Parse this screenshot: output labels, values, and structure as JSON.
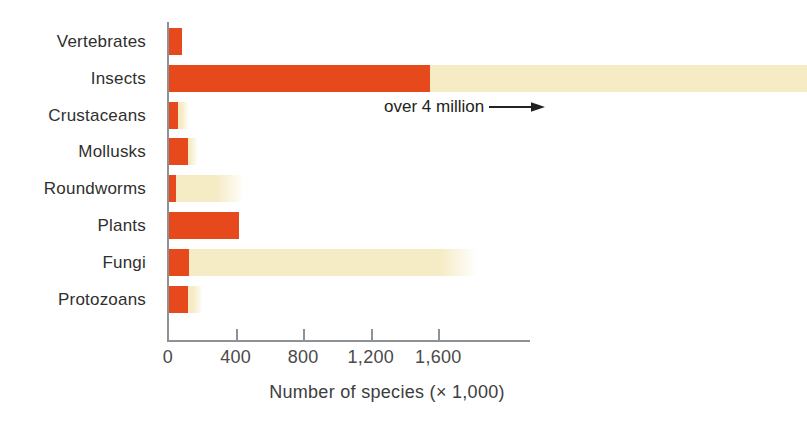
{
  "chart_data": {
    "type": "bar",
    "orientation": "horizontal",
    "xlabel": "Number of species (× 1,000)",
    "x_ticks": [
      0,
      400,
      800,
      1200,
      1600
    ],
    "x_tick_labels": [
      "0",
      "400",
      "800",
      "1,200",
      "1,600"
    ],
    "xlim": [
      0,
      2150
    ],
    "grid": false,
    "legend": "none",
    "annotation": {
      "text": "over 4 million",
      "refers_to": "Insects",
      "arrow_direction": "right"
    },
    "categories": [
      "Vertebrates",
      "Insects",
      "Crustaceans",
      "Mollusks",
      "Roundworms",
      "Plants",
      "Fungi",
      "Protozoans"
    ],
    "bars": [
      {
        "label": "Vertebrates",
        "red_k": 80,
        "cream_k": null,
        "fade_from_k": null,
        "cream_to_edge": false
      },
      {
        "label": "Insects",
        "red_k": 1550,
        "cream_k": null,
        "fade_from_k": null,
        "cream_to_edge": true
      },
      {
        "label": "Crustaceans",
        "red_k": 60,
        "cream_k": 125,
        "fade_from_k": 80,
        "cream_to_edge": false
      },
      {
        "label": "Mollusks",
        "red_k": 120,
        "cream_k": 175,
        "fade_from_k": 130,
        "cream_to_edge": false
      },
      {
        "label": "Roundworms",
        "red_k": 50,
        "cream_k": 450,
        "fade_from_k": 290,
        "cream_to_edge": false
      },
      {
        "label": "Plants",
        "red_k": 420,
        "cream_k": null,
        "fade_from_k": null,
        "cream_to_edge": false
      },
      {
        "label": "Fungi",
        "red_k": 125,
        "cream_k": 1830,
        "fade_from_k": 1600,
        "cream_to_edge": false
      },
      {
        "label": "Protozoans",
        "red_k": 120,
        "cream_k": 210,
        "fade_from_k": 150,
        "cream_to_edge": false
      }
    ],
    "colors": {
      "bar_red": "#e5491c",
      "bar_cream": "#f5ebc4",
      "axis": "#8e9196",
      "text": "#2f2f2f"
    }
  }
}
